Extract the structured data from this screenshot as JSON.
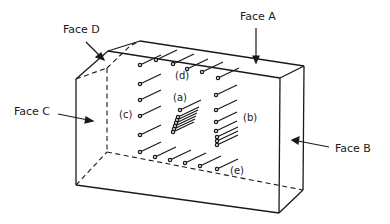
{
  "diagram": {
    "stroke_color": "#1a1a1a",
    "background": "#ffffff",
    "face_labels": {
      "face_a": "Face A",
      "face_b": "Face B",
      "face_c": "Face C",
      "face_d": "Face D"
    },
    "group_labels": {
      "a": "(a)",
      "b": "(b)",
      "c": "(c)",
      "d": "(d)",
      "e": "(e)"
    },
    "groups": [
      {
        "id": "d",
        "name": "top row",
        "points": [
          [
            140,
            65
          ],
          [
            156,
            60
          ],
          [
            173,
            64
          ],
          [
            187,
            69
          ],
          [
            202,
            72
          ],
          [
            218,
            78
          ]
        ]
      },
      {
        "id": "c",
        "name": "left column",
        "points": [
          [
            140,
            84
          ],
          [
            140,
            100
          ],
          [
            140,
            116
          ],
          [
            140,
            135
          ]
        ]
      },
      {
        "id": "a",
        "name": "center cluster",
        "points": [
          [
            180,
            110
          ],
          [
            178,
            117
          ],
          [
            177,
            120
          ],
          [
            176,
            123
          ],
          [
            175,
            126
          ],
          [
            174,
            129
          ],
          [
            173,
            132
          ]
        ]
      },
      {
        "id": "b",
        "name": "right column",
        "points": [
          [
            216,
            95
          ],
          [
            216,
            110
          ],
          [
            216,
            122
          ],
          [
            216,
            131
          ],
          [
            217,
            137
          ],
          [
            217,
            141
          ],
          [
            217,
            145
          ]
        ]
      },
      {
        "id": "e",
        "name": "bottom row",
        "points": [
          [
            140,
            152
          ],
          [
            155,
            157
          ],
          [
            170,
            160
          ],
          [
            185,
            163
          ],
          [
            200,
            166
          ],
          [
            217,
            169
          ]
        ]
      }
    ]
  }
}
